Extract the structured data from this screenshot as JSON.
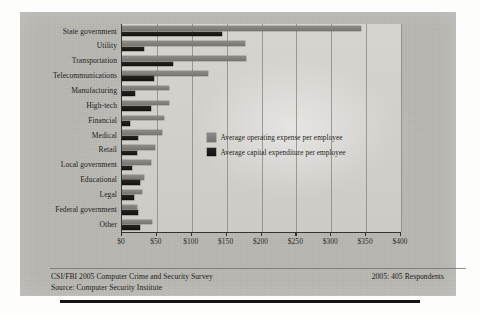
{
  "chart_data": {
    "type": "bar",
    "orientation": "horizontal",
    "title": "",
    "xlabel": "",
    "ylabel": "",
    "xlim": [
      0,
      400
    ],
    "xticks": [
      0,
      50,
      100,
      150,
      200,
      250,
      300,
      350,
      400
    ],
    "xticklabels": [
      "$0",
      "$50",
      "$100",
      "$150",
      "$200",
      "$250",
      "$300",
      "$350",
      "$400"
    ],
    "grid": true,
    "legend_position": "inside-right",
    "categories": [
      "State government",
      "Utility",
      "Transportation",
      "Telecommunications",
      "Manufacturing",
      "High-tech",
      "Financial",
      "Medical",
      "Retail",
      "Local government",
      "Educational",
      "Legal",
      "Federal government",
      "Other"
    ],
    "series": [
      {
        "name": "Average operating expense per employee",
        "color": "#817f7a",
        "values": [
          342,
          177,
          178,
          123,
          68,
          67,
          60,
          58,
          47,
          41,
          32,
          29,
          21,
          43
        ]
      },
      {
        "name": "Average capital expenditure per employee",
        "color": "#1b1915",
        "values": [
          143,
          31,
          73,
          46,
          18,
          41,
          11,
          23,
          22,
          15,
          26,
          17,
          23,
          26
        ]
      }
    ]
  },
  "legend": {
    "items": [
      {
        "label": "Average operating expense per employee",
        "swatch": "light"
      },
      {
        "label": "Average capital expenditure per employee",
        "swatch": "dark"
      }
    ]
  },
  "footer": {
    "line1": "CSI/FBI 2005 Computer Crime and Security Survey",
    "line2": "Source: Computer Security Institute",
    "respondents": "2005: 405 Respondents"
  }
}
